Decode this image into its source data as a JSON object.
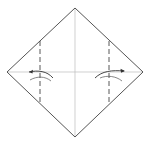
{
  "diagram": {
    "type": "origami-fold-diagram",
    "colors": {
      "paper_outline": "#555555",
      "crease_line": "#bbbbbb",
      "fold_line": "#444444",
      "arrow": "#333333",
      "background": "#ffffff"
    },
    "diamond": {
      "top": [
        75,
        8
      ],
      "right": [
        143,
        72
      ],
      "bottom": [
        75,
        137
      ],
      "left": [
        7,
        72
      ]
    },
    "creases": [
      {
        "name": "vertical-center-crease",
        "from": [
          75,
          8
        ],
        "to": [
          75,
          137
        ]
      },
      {
        "name": "horizontal-center-crease",
        "from": [
          7,
          72
        ],
        "to": [
          143,
          72
        ]
      }
    ],
    "valley_folds": [
      {
        "name": "left-valley-fold",
        "x": 40,
        "y_from": 41,
        "y_to": 104
      },
      {
        "name": "right-valley-fold",
        "x": 109,
        "y_from": 41,
        "y_to": 104
      }
    ],
    "arrows": [
      {
        "name": "left-fold-arrow",
        "direction": "left"
      },
      {
        "name": "right-fold-arrow",
        "direction": "right"
      }
    ]
  }
}
